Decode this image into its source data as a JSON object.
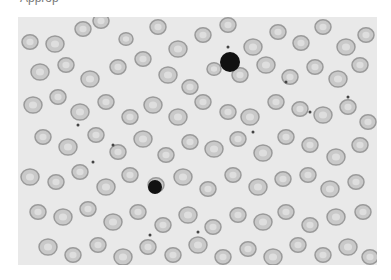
{
  "caption": "Approp",
  "image": {
    "description": "Peripheral blood smear micrograph showing red blood cells, one dark-staining lymphocyte nucleus, and scattered platelets",
    "background": "#e9e9e9",
    "cell_fill": "#c9c9c9",
    "cell_rim": "#9a9a9a",
    "cell_center": "#dedede",
    "dark_cell": "#111111",
    "cells": [
      [
        12,
        25,
        8
      ],
      [
        37,
        27,
        9
      ],
      [
        65,
        12,
        8
      ],
      [
        83,
        4,
        8
      ],
      [
        108,
        22,
        7
      ],
      [
        140,
        10,
        8
      ],
      [
        160,
        32,
        9
      ],
      [
        185,
        18,
        8
      ],
      [
        210,
        8,
        8
      ],
      [
        235,
        30,
        9
      ],
      [
        260,
        15,
        8
      ],
      [
        283,
        26,
        8
      ],
      [
        305,
        10,
        8
      ],
      [
        328,
        30,
        9
      ],
      [
        348,
        18,
        8
      ],
      [
        22,
        55,
        9
      ],
      [
        48,
        48,
        8
      ],
      [
        72,
        62,
        9
      ],
      [
        100,
        50,
        8
      ],
      [
        125,
        42,
        8
      ],
      [
        150,
        58,
        9
      ],
      [
        172,
        70,
        8
      ],
      [
        196,
        52,
        7
      ],
      [
        222,
        58,
        8
      ],
      [
        248,
        48,
        9
      ],
      [
        272,
        60,
        8
      ],
      [
        297,
        50,
        8
      ],
      [
        320,
        62,
        9
      ],
      [
        342,
        48,
        8
      ],
      [
        15,
        88,
        9
      ],
      [
        40,
        80,
        8
      ],
      [
        62,
        95,
        9
      ],
      [
        88,
        85,
        8
      ],
      [
        112,
        100,
        8
      ],
      [
        135,
        88,
        9
      ],
      [
        160,
        100,
        9
      ],
      [
        185,
        85,
        8
      ],
      [
        210,
        95,
        8
      ],
      [
        232,
        100,
        9
      ],
      [
        258,
        85,
        8
      ],
      [
        282,
        92,
        8
      ],
      [
        305,
        98,
        9
      ],
      [
        330,
        90,
        8
      ],
      [
        350,
        105,
        8
      ],
      [
        25,
        120,
        8
      ],
      [
        50,
        130,
        9
      ],
      [
        78,
        118,
        8
      ],
      [
        100,
        135,
        8
      ],
      [
        125,
        122,
        9
      ],
      [
        148,
        138,
        8
      ],
      [
        172,
        125,
        8
      ],
      [
        196,
        132,
        9
      ],
      [
        220,
        122,
        8
      ],
      [
        245,
        136,
        9
      ],
      [
        268,
        120,
        8
      ],
      [
        292,
        128,
        8
      ],
      [
        318,
        140,
        9
      ],
      [
        342,
        128,
        8
      ],
      [
        12,
        160,
        9
      ],
      [
        38,
        165,
        8
      ],
      [
        62,
        155,
        8
      ],
      [
        88,
        170,
        9
      ],
      [
        112,
        158,
        8
      ],
      [
        138,
        168,
        8
      ],
      [
        165,
        160,
        9
      ],
      [
        190,
        172,
        8
      ],
      [
        215,
        158,
        8
      ],
      [
        240,
        170,
        9
      ],
      [
        265,
        162,
        8
      ],
      [
        290,
        158,
        8
      ],
      [
        312,
        172,
        9
      ],
      [
        338,
        165,
        8
      ],
      [
        20,
        195,
        8
      ],
      [
        45,
        200,
        9
      ],
      [
        70,
        192,
        8
      ],
      [
        95,
        205,
        9
      ],
      [
        120,
        195,
        8
      ],
      [
        145,
        208,
        8
      ],
      [
        170,
        198,
        9
      ],
      [
        195,
        210,
        8
      ],
      [
        220,
        198,
        8
      ],
      [
        245,
        205,
        9
      ],
      [
        268,
        195,
        8
      ],
      [
        292,
        208,
        8
      ],
      [
        318,
        200,
        9
      ],
      [
        345,
        195,
        8
      ],
      [
        30,
        230,
        9
      ],
      [
        55,
        238,
        8
      ],
      [
        80,
        228,
        8
      ],
      [
        105,
        240,
        9
      ],
      [
        130,
        230,
        8
      ],
      [
        155,
        238,
        8
      ],
      [
        180,
        228,
        9
      ],
      [
        205,
        240,
        8
      ],
      [
        230,
        232,
        8
      ],
      [
        255,
        240,
        9
      ],
      [
        280,
        228,
        8
      ],
      [
        305,
        238,
        8
      ],
      [
        330,
        230,
        9
      ],
      [
        352,
        240,
        8
      ]
    ],
    "dark_cells": [
      [
        212,
        45,
        10
      ],
      [
        137,
        170,
        7
      ]
    ],
    "platelets": [
      [
        60,
        108
      ],
      [
        95,
        128
      ],
      [
        210,
        30
      ],
      [
        268,
        65
      ],
      [
        292,
        95
      ],
      [
        132,
        218
      ],
      [
        180,
        215
      ],
      [
        235,
        115
      ],
      [
        330,
        80
      ],
      [
        75,
        145
      ]
    ]
  }
}
